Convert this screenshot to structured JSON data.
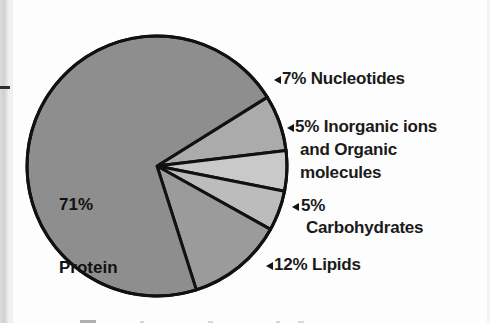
{
  "figure": {
    "name": "cell-composition-pie-chart",
    "background": "#fdfdfd"
  },
  "chart_data": {
    "type": "pie",
    "title": "",
    "subtitle": "",
    "xlabel": "",
    "ylabel": "",
    "legend_position": "outside-right",
    "grid": false,
    "units": "percent",
    "total": 100,
    "categories": [
      "Protein",
      "Nucleotides",
      "Inorganic ions and Organic molecules",
      "Carbohydrates",
      "Lipids"
    ],
    "values": [
      71,
      7,
      5,
      5,
      12
    ],
    "colors": [
      "#8e8e8e",
      "#ababab",
      "#c9c9c9",
      "#bcbcbc",
      "#9b9b9b"
    ],
    "slice_order": [
      {
        "name": "Nucleotides",
        "value": 7,
        "color": "#ababab",
        "start_deg": -32,
        "end_deg": -6.8
      },
      {
        "name": "Inorganic ions and Organic molecules",
        "value": 5,
        "color": "#c9c9c9",
        "start_deg": -6.8,
        "end_deg": 11.2
      },
      {
        "name": "Carbohydrates",
        "value": 5,
        "color": "#bcbcbc",
        "start_deg": 11.2,
        "end_deg": 29.2
      },
      {
        "name": "Lipids",
        "value": 12,
        "color": "#9b9b9b",
        "start_deg": 29.2,
        "end_deg": 72.4
      },
      {
        "name": "Protein",
        "value": 71,
        "color": "#8e8e8e",
        "start_deg": 72.4,
        "end_deg": 328
      }
    ],
    "stroke": "#111111",
    "stroke_width": 3
  },
  "pie": {
    "center_x": 157,
    "center_y": 166,
    "radius": 130
  },
  "inner_label": {
    "line1": "71%",
    "line2": "Protein"
  },
  "callouts": [
    {
      "key": "nucleotides",
      "marker": "left-triangle",
      "lines": [
        "7% Nucleotides"
      ]
    },
    {
      "key": "inorganic",
      "marker": "left-triangle",
      "lines": [
        "5% Inorganic ions",
        "and Organic",
        "molecules"
      ]
    },
    {
      "key": "carbohydrates",
      "marker": "left-triangle",
      "lines": [
        "5%",
        "Carbohydrates"
      ]
    },
    {
      "key": "lipids",
      "marker": "left-triangle",
      "lines": [
        "12% Lipids"
      ]
    }
  ]
}
